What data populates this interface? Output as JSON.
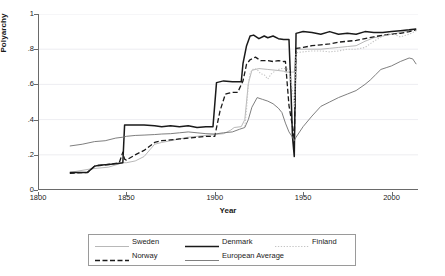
{
  "axes": {
    "ylabel": "Polyarchy",
    "xlabel": "Year",
    "yticks": [
      "1",
      ".8",
      ".6",
      ".4",
      ".2",
      "0"
    ],
    "xticks": [
      "1800",
      "1850",
      "1900",
      "1950",
      "2000"
    ]
  },
  "legend": {
    "entries": [
      {
        "label": "Sweden",
        "style": "solid-light",
        "color": "#b0b0b0"
      },
      {
        "label": "Denmark",
        "style": "solid-thick",
        "color": "#1a1a1a"
      },
      {
        "label": "Finland",
        "style": "dotted",
        "color": "#c4c4c4"
      },
      {
        "label": "Norway",
        "style": "dashed",
        "color": "#1a1a1a"
      },
      {
        "label": "European Average",
        "style": "solid-medium",
        "color": "#707070"
      }
    ]
  },
  "chart_data": {
    "type": "line",
    "title": "",
    "xlabel": "Year",
    "ylabel": "Polyarchy",
    "xlim": [
      1800,
      2015
    ],
    "ylim": [
      0,
      1
    ],
    "grid": true,
    "legend_position": "below",
    "series": [
      {
        "name": "Sweden",
        "color": "#b0b0b0",
        "style": "solid-light",
        "x": [
          1818,
          1830,
          1840,
          1848,
          1850,
          1855,
          1860,
          1866,
          1870,
          1875,
          1880,
          1885,
          1890,
          1895,
          1900,
          1905,
          1909,
          1911,
          1915,
          1917,
          1919,
          1921,
          1925,
          1930,
          1935,
          1939,
          1940,
          1944,
          1945,
          1946,
          1950,
          1955,
          1960,
          1965,
          1970,
          1975,
          1980,
          1985,
          1990,
          1995,
          2000,
          2005,
          2010,
          2014
        ],
        "y": [
          0.1,
          0.12,
          0.13,
          0.155,
          0.155,
          0.165,
          0.19,
          0.26,
          0.27,
          0.28,
          0.29,
          0.3,
          0.305,
          0.31,
          0.315,
          0.32,
          0.34,
          0.355,
          0.36,
          0.4,
          0.605,
          0.68,
          0.69,
          0.685,
          0.68,
          0.675,
          0.67,
          0.67,
          0.67,
          0.8,
          0.8,
          0.8,
          0.8,
          0.805,
          0.81,
          0.815,
          0.82,
          0.845,
          0.865,
          0.875,
          0.885,
          0.895,
          0.905,
          0.915
        ]
      },
      {
        "name": "Denmark",
        "color": "#1a1a1a",
        "style": "solid-thick",
        "x": [
          1818,
          1828,
          1832,
          1834,
          1840,
          1845,
          1848,
          1849,
          1855,
          1860,
          1866,
          1870,
          1875,
          1880,
          1885,
          1890,
          1895,
          1899,
          1901,
          1905,
          1910,
          1915,
          1916,
          1918,
          1920,
          1922,
          1925,
          1928,
          1930,
          1933,
          1936,
          1939,
          1940,
          1942,
          1943,
          1944,
          1945,
          1946,
          1950,
          1955,
          1960,
          1965,
          1970,
          1975,
          1980,
          1985,
          1990,
          1995,
          2000,
          2005,
          2010,
          2014
        ],
        "y": [
          0.1,
          0.1,
          0.135,
          0.14,
          0.145,
          0.15,
          0.155,
          0.37,
          0.37,
          0.37,
          0.365,
          0.36,
          0.365,
          0.36,
          0.365,
          0.355,
          0.36,
          0.36,
          0.61,
          0.62,
          0.615,
          0.615,
          0.72,
          0.82,
          0.875,
          0.88,
          0.86,
          0.875,
          0.865,
          0.875,
          0.86,
          0.855,
          0.855,
          0.855,
          0.6,
          0.3,
          0.19,
          0.89,
          0.9,
          0.895,
          0.885,
          0.9,
          0.885,
          0.89,
          0.885,
          0.9,
          0.895,
          0.895,
          0.9,
          0.905,
          0.91,
          0.915
        ]
      },
      {
        "name": "Norway",
        "color": "#1a1a1a",
        "style": "dashed",
        "x": [
          1818,
          1828,
          1832,
          1836,
          1842,
          1846,
          1848,
          1849,
          1850,
          1855,
          1860,
          1866,
          1870,
          1875,
          1880,
          1885,
          1890,
          1895,
          1900,
          1903,
          1906,
          1908,
          1910,
          1913,
          1916,
          1918,
          1920,
          1923,
          1926,
          1930,
          1933,
          1936,
          1939,
          1940,
          1942,
          1944,
          1945,
          1946,
          1950,
          1955,
          1960,
          1965,
          1970,
          1975,
          1980,
          1985,
          1990,
          1995,
          2000,
          2005,
          2010,
          2014
        ],
        "y": [
          0.095,
          0.1,
          0.135,
          0.14,
          0.148,
          0.155,
          0.215,
          0.175,
          0.17,
          0.2,
          0.225,
          0.27,
          0.28,
          0.285,
          0.29,
          0.295,
          0.3,
          0.305,
          0.305,
          0.45,
          0.545,
          0.55,
          0.555,
          0.555,
          0.62,
          0.715,
          0.74,
          0.755,
          0.735,
          0.735,
          0.73,
          0.735,
          0.73,
          0.73,
          0.48,
          0.36,
          0.285,
          0.805,
          0.81,
          0.82,
          0.825,
          0.83,
          0.84,
          0.845,
          0.85,
          0.86,
          0.87,
          0.88,
          0.885,
          0.89,
          0.9,
          0.91
        ]
      },
      {
        "name": "Finland",
        "color": "#c4c4c4",
        "style": "dotted",
        "x": [
          1917,
          1918,
          1919,
          1920,
          1922,
          1924,
          1926,
          1928,
          1930,
          1932,
          1934,
          1936,
          1938,
          1940,
          1942,
          1944,
          1945,
          1946,
          1950,
          1955,
          1960,
          1965,
          1970,
          1975,
          1980,
          1985,
          1990,
          1995,
          2000,
          2005,
          2010,
          2014
        ],
        "y": [
          0.36,
          0.46,
          0.6,
          0.665,
          0.69,
          0.685,
          0.66,
          0.655,
          0.63,
          0.66,
          0.675,
          0.685,
          0.69,
          0.69,
          0.685,
          0.565,
          0.47,
          0.78,
          0.785,
          0.79,
          0.79,
          0.785,
          0.79,
          0.8,
          0.8,
          0.81,
          0.845,
          0.875,
          0.89,
          0.87,
          0.885,
          0.905
        ]
      },
      {
        "name": "European Average",
        "color": "#707070",
        "style": "solid-medium",
        "x": [
          1818,
          1825,
          1832,
          1838,
          1844,
          1848,
          1850,
          1855,
          1860,
          1866,
          1870,
          1875,
          1880,
          1885,
          1890,
          1895,
          1900,
          1905,
          1910,
          1914,
          1917,
          1919,
          1921,
          1924,
          1927,
          1930,
          1933,
          1936,
          1938,
          1940,
          1942,
          1944,
          1945,
          1946,
          1950,
          1955,
          1960,
          1965,
          1970,
          1975,
          1980,
          1985,
          1988,
          1991,
          1994,
          1997,
          2000,
          2005,
          2010,
          2012,
          2014
        ],
        "y": [
          0.25,
          0.26,
          0.275,
          0.28,
          0.295,
          0.3,
          0.305,
          0.31,
          0.312,
          0.315,
          0.318,
          0.32,
          0.325,
          0.33,
          0.325,
          0.32,
          0.318,
          0.325,
          0.33,
          0.345,
          0.355,
          0.4,
          0.47,
          0.525,
          0.515,
          0.505,
          0.49,
          0.465,
          0.44,
          0.38,
          0.33,
          0.3,
          0.28,
          0.3,
          0.36,
          0.42,
          0.475,
          0.5,
          0.525,
          0.545,
          0.565,
          0.6,
          0.625,
          0.655,
          0.685,
          0.695,
          0.705,
          0.73,
          0.75,
          0.745,
          0.715
        ]
      }
    ]
  }
}
